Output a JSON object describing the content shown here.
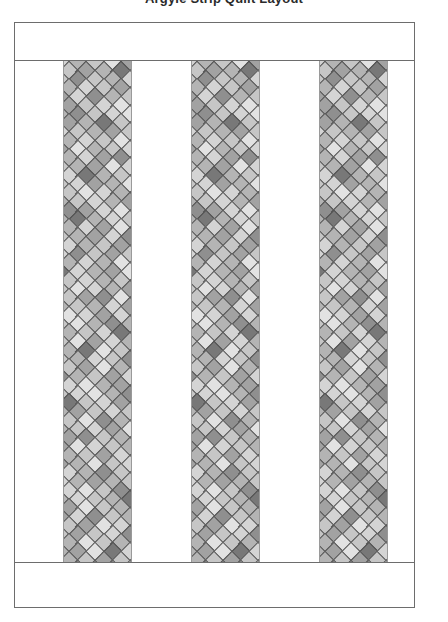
{
  "caption": {
    "text": "Argyle Strip Quilt Layout"
  },
  "diagram": {
    "frame": {
      "border_color": "#6d6d6d",
      "background_color": "#ffffff",
      "left": 14,
      "top": 22,
      "width": 401,
      "height": 586
    },
    "bands": [
      {
        "name": "top-border-band",
        "label": "",
        "height": 37
      },
      {
        "name": "bottom-border-band",
        "label": "",
        "height": 45
      }
    ],
    "strips": [
      {
        "name": "strip-1",
        "left": 48,
        "width": 69
      },
      {
        "name": "strip-2",
        "left": 176,
        "width": 69
      },
      {
        "name": "strip-3",
        "left": 304,
        "width": 69
      }
    ],
    "strip_border_color": "#9a9a9a"
  },
  "pattern": {
    "name": "argyle-diamond",
    "diamond_size": 16,
    "cell_pitch": 17.5,
    "outline_color": "#4a4a4a",
    "palette": {
      "lightest": "#e2e2e2",
      "light": "#d4d4d4",
      "mid_light": "#c6c6c6",
      "mid": "#b4b4b4",
      "mid_dark": "#a2a2a2",
      "dark": "#8f8f8f",
      "darkest": "#787878"
    },
    "shade_grid": [
      [
        "#d4d4d4",
        "#b4b4b4",
        "#c6c6c6",
        "#e2e2e2",
        "#a2a2a2"
      ],
      [
        "#e2e2e2",
        "#c6c6c6",
        "#a2a2a2",
        "#b4b4b4",
        "#787878"
      ],
      [
        "#b4b4b4",
        "#d4d4d4",
        "#c6c6c6",
        "#8f8f8f",
        "#c6c6c6"
      ],
      [
        "#c6c6c6",
        "#a2a2a2",
        "#e2e2e2",
        "#b4b4b4",
        "#d4d4d4"
      ],
      [
        "#d4d4d4",
        "#8f8f8f",
        "#b4b4b4",
        "#c6c6c6",
        "#a2a2a2"
      ],
      [
        "#a2a2a2",
        "#c6c6c6",
        "#d4d4d4",
        "#e2e2e2",
        "#b4b4b4"
      ],
      [
        "#e2e2e2",
        "#b4b4b4",
        "#8f8f8f",
        "#c6c6c6",
        "#d4d4d4"
      ],
      [
        "#c6c6c6",
        "#d4d4d4",
        "#a2a2a2",
        "#b4b4b4",
        "#787878"
      ],
      [
        "#b4b4b4",
        "#a2a2a2",
        "#c6c6c6",
        "#d4d4d4",
        "#c6c6c6"
      ],
      [
        "#d4d4d4",
        "#c6c6c6",
        "#e2e2e2",
        "#8f8f8f",
        "#b4b4b4"
      ],
      [
        "#a2a2a2",
        "#e2e2e2",
        "#b4b4b4",
        "#c6c6c6",
        "#d4d4d4"
      ],
      [
        "#c6c6c6",
        "#b4b4b4",
        "#d4d4d4",
        "#a2a2a2",
        "#8f8f8f"
      ],
      [
        "#e2e2e2",
        "#d4d4d4",
        "#c6c6c6",
        "#b4b4b4",
        "#a2a2a2"
      ],
      [
        "#b4b4b4",
        "#c6c6c6",
        "#a2a2a2",
        "#d4d4d4",
        "#787878"
      ],
      [
        "#d4d4d4",
        "#a2a2a2",
        "#b4b4b4",
        "#e2e2e2",
        "#c6c6c6"
      ],
      [
        "#c6c6c6",
        "#e2e2e2",
        "#d4d4d4",
        "#b4b4b4",
        "#8f8f8f"
      ],
      [
        "#a2a2a2",
        "#b4b4b4",
        "#c6c6c6",
        "#d4d4d4",
        "#b4b4b4"
      ],
      [
        "#e2e2e2",
        "#c6c6c6",
        "#8f8f8f",
        "#a2a2a2",
        "#d4d4d4"
      ],
      [
        "#b4b4b4",
        "#d4d4d4",
        "#c6c6c6",
        "#b4b4b4",
        "#787878"
      ],
      [
        "#d4d4d4",
        "#a2a2a2",
        "#e2e2e2",
        "#c6c6c6",
        "#b4b4b4"
      ],
      [
        "#c6c6c6",
        "#b4b4b4",
        "#a2a2a2",
        "#d4d4d4",
        "#8f8f8f"
      ],
      [
        "#e2e2e2",
        "#d4d4d4",
        "#b4b4b4",
        "#c6c6c6",
        "#a2a2a2"
      ],
      [
        "#a2a2a2",
        "#c6c6c6",
        "#d4d4d4",
        "#8f8f8f",
        "#c6c6c6"
      ],
      [
        "#b4b4b4",
        "#e2e2e2",
        "#c6c6c6",
        "#b4b4b4",
        "#d4d4d4"
      ],
      [
        "#d4d4d4",
        "#b4b4b4",
        "#a2a2a2",
        "#e2e2e2",
        "#787878"
      ],
      [
        "#c6c6c6",
        "#d4d4d4",
        "#b4b4b4",
        "#c6c6c6",
        "#a2a2a2"
      ],
      [
        "#a2a2a2",
        "#c6c6c6",
        "#e2e2e2",
        "#d4d4d4",
        "#b4b4b4"
      ],
      [
        "#e2e2e2",
        "#b4b4b4",
        "#c6c6c6",
        "#a2a2a2",
        "#8f8f8f"
      ],
      [
        "#b4b4b4",
        "#d4d4d4",
        "#a2a2a2",
        "#b4b4b4",
        "#c6c6c6"
      ],
      [
        "#d4d4d4",
        "#a2a2a2",
        "#d4d4d4",
        "#c6c6c6",
        "#e2e2e2"
      ],
      [
        "#c6c6c6",
        "#e2e2e2",
        "#b4b4b4",
        "#8f8f8f",
        "#b4b4b4"
      ],
      [
        "#a2a2a2",
        "#b4b4b4",
        "#c6c6c6",
        "#d4d4d4",
        "#787878"
      ]
    ]
  }
}
